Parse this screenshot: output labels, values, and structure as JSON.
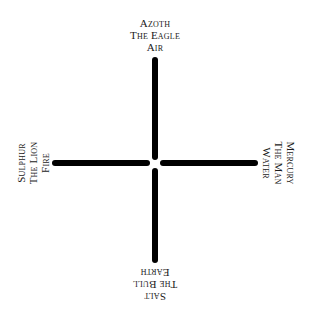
{
  "diagram": {
    "type": "cross",
    "colors": {
      "background": "#ffffff",
      "lines": "#000000",
      "text": "#1a1a1a"
    },
    "top": {
      "principle": "Azoth",
      "creature": "The Eagle",
      "element": "Air"
    },
    "left": {
      "principle": "Sulphur",
      "creature": "The Lion",
      "element": "Fire"
    },
    "right": {
      "principle": "Mercury",
      "creature": "The Man",
      "element": "Water"
    },
    "bottom": {
      "principle": "Salt",
      "creature": "The Bull",
      "element": "Earth"
    }
  }
}
